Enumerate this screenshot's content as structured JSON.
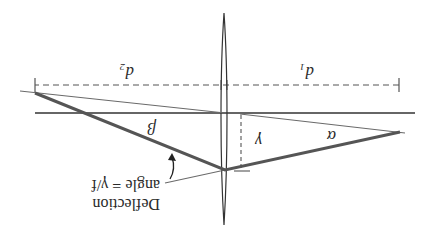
{
  "figure": {
    "orientation": "rotated 180 degrees",
    "colors": {
      "background": "#ffffff",
      "ink": "#2a2a2a",
      "thick_ray": "#555555",
      "thin_ray": "#6a6a6a"
    }
  },
  "labels": {
    "d1": "d₁",
    "d2": "d₂",
    "alpha": "α",
    "beta": "β",
    "gamma": "γ",
    "deflection_line1": "Deflection",
    "deflection_line2": "angle = γ/f"
  },
  "elements": {
    "lens": "thin-lens",
    "optical_axis": "horizontal-axis",
    "dimension_line": "dashed-dimension",
    "ray": "refracted-ray",
    "height_marker": "dashed-vertical-gamma"
  }
}
